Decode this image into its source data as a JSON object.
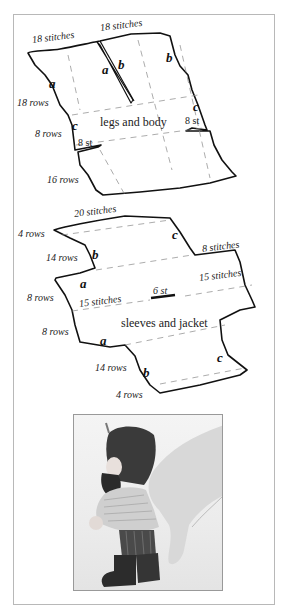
{
  "pattern_pieces": [
    {
      "name": "legs and body",
      "title": "legs and body",
      "labels": {
        "top_left_width": "18 stitches",
        "top_right_width": "18 stitches",
        "left_upper_rows": "18 rows",
        "left_middle_rows": "8 rows",
        "left_lower_rows": "16 rows",
        "left_slit": "8 st",
        "right_slit": "8 st"
      },
      "edge_letters": {
        "left_a": "a",
        "center_a": "a",
        "center_b": "b",
        "right_b": "b",
        "left_c": "c",
        "right_c": "c"
      }
    },
    {
      "name": "sleeves and jacket",
      "title": "sleeves and jacket",
      "labels": {
        "top_width": "20 stitches",
        "top_rows": "4 rows",
        "upper_left_rows": "14 rows",
        "right_shoulder_width": "8 stitches",
        "left_mid_upper_rows": "8 rows",
        "left_mid_lower_rows": "8 rows",
        "left_center_width": "15 stitches",
        "right_center_width": "15 stitches",
        "neck_opening": "6 st",
        "bottom_rows_14": "14 rows",
        "bottom_rows_4": "4 rows"
      },
      "edge_letters": {
        "upper_b": "b",
        "upper_c": "c",
        "upper_a": "a",
        "lower_a": "a",
        "lower_b": "b",
        "lower_c": "c"
      }
    }
  ],
  "photo": {
    "description": "knitted gnome finger puppet on a hand",
    "alt": "Finished knitted gnome puppet with dark hat, beard, light jacket, striped trousers and dark boots"
  },
  "colors": {
    "ink": "#111111",
    "frame": "#b8b8b8",
    "dash": "#888888"
  }
}
